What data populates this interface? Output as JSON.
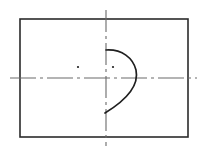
{
  "canvas": {
    "width": 206,
    "height": 152,
    "background": "#ffffff"
  },
  "drawing": {
    "title": "Cam profile technical drawing",
    "type": "engineering-line-drawing",
    "colors": {
      "outline": "#2b2b2b",
      "centerline": "#6a6a6a",
      "curve": "#1f1f1f",
      "dot": "#1f1f1f",
      "background": "#ffffff"
    },
    "outline_rectangle": {
      "x": 20,
      "y": 19,
      "width": 168,
      "height": 118,
      "stroke_width": 1.6
    },
    "horizontal_centerline": {
      "y": 78,
      "x_start": 10,
      "x_end": 197,
      "dash_pattern": "26 4 3 4",
      "stroke_width": 1.1
    },
    "vertical_centerline": {
      "x": 106,
      "y_start": 10,
      "y_end": 146,
      "dash_pattern": "22 4 3 4",
      "stroke_width": 1.1
    },
    "cam_curve": {
      "path": "M 106 50 C 122 49 133 58 136 70 C 139 84 128 99 105 113",
      "start_point": [
        106,
        50
      ],
      "end_point": [
        105,
        113
      ],
      "rightmost_x": 137,
      "stroke_width": 1.7,
      "closed": false
    },
    "center_dots": [
      {
        "name": "left-center-dot",
        "cx": 78,
        "cy": 67,
        "r": 1.1
      },
      {
        "name": "right-center-dot",
        "cx": 113,
        "cy": 67,
        "r": 1.1
      }
    ]
  }
}
